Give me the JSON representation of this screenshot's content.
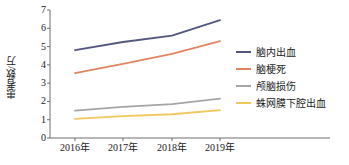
{
  "chart_data": {
    "type": "line",
    "title": "",
    "xlabel": "",
    "ylabel": "患者数/万",
    "categories": [
      "2016年",
      "2017年",
      "2018年",
      "2019年"
    ],
    "x": [
      2016,
      2017,
      2018,
      2019
    ],
    "ylim": [
      0,
      7
    ],
    "yticks": [
      "0",
      "1",
      "2",
      "3",
      "4",
      "5",
      "6",
      "7"
    ],
    "grid": false,
    "legend_position": "right",
    "series": [
      {
        "name": "脑内出血",
        "color": "#53577f",
        "values": [
          4.8,
          5.25,
          5.6,
          6.45
        ]
      },
      {
        "name": "脑梗死",
        "color": "#e08560",
        "values": [
          3.55,
          4.05,
          4.6,
          5.3
        ]
      },
      {
        "name": "颅脑损伤",
        "color": "#a5a5a5",
        "values": [
          1.5,
          1.7,
          1.85,
          2.15
        ]
      },
      {
        "name": "蛛网膜下腔出血",
        "color": "#f2c75c",
        "values": [
          1.05,
          1.2,
          1.3,
          1.52
        ]
      }
    ]
  },
  "axis": {
    "line_color": "#6e6e6e",
    "tick_color": "#6e6e6e"
  }
}
